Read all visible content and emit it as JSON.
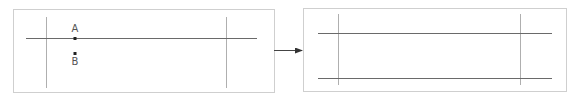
{
  "diagram": {
    "left_panel": {
      "box": {
        "x": 13,
        "y": 9,
        "w": 261,
        "h": 83
      },
      "vertical_lines": [
        {
          "x": 46,
          "y1": 17,
          "y2": 88
        },
        {
          "x": 226,
          "y1": 17,
          "y2": 88
        }
      ],
      "horizontal_lines": [
        {
          "y": 38,
          "x1": 26,
          "x2": 257
        }
      ],
      "points": [
        {
          "label": "A",
          "x": 75,
          "y": 38,
          "label_x": 75,
          "label_y": 32
        },
        {
          "label": "B",
          "x": 75,
          "y": 53,
          "label_x": 75,
          "label_y": 65
        }
      ]
    },
    "arrow": {
      "x1": 274,
      "y1": 50,
      "x2": 302,
      "y2": 50
    },
    "right_panel": {
      "box": {
        "x": 303,
        "y": 8,
        "w": 263,
        "h": 83
      },
      "vertical_lines": [
        {
          "x": 338,
          "y1": 14,
          "y2": 85
        },
        {
          "x": 520,
          "y1": 14,
          "y2": 85
        }
      ],
      "horizontal_lines": [
        {
          "y": 33,
          "x1": 318,
          "x2": 552
        },
        {
          "y": 78,
          "x1": 318,
          "x2": 552
        }
      ]
    },
    "colors": {
      "frame": "#cfcfcf",
      "vertical": "#9a9a9a",
      "horizontal": "#6a6a6a",
      "point": "#222222",
      "label": "#555555",
      "arrow": "#444444"
    }
  }
}
